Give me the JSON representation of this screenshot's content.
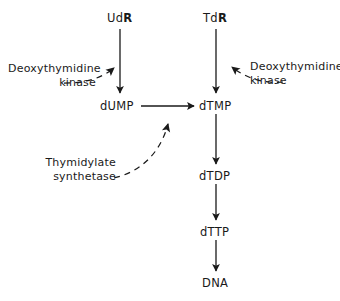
{
  "diagram": {
    "background_color": "#ffffff",
    "stroke_color": "#1a1a1a",
    "text_color": "#1a1a1a",
    "nodes": [
      {
        "id": "udr",
        "label_prefix": "Ud",
        "label_bold": "R",
        "label_suffix": "",
        "x": 107,
        "y": 12
      },
      {
        "id": "tdr",
        "label_prefix": "Td",
        "label_bold": "R",
        "label_suffix": "",
        "x": 203,
        "y": 12
      },
      {
        "id": "dump",
        "label_prefix": "dUMP",
        "label_bold": "",
        "label_suffix": "",
        "x": 100,
        "y": 100
      },
      {
        "id": "dtmp",
        "label_prefix": "dTMP",
        "label_bold": "",
        "label_suffix": "",
        "x": 199,
        "y": 100
      },
      {
        "id": "dtdp",
        "label_prefix": "dTDP",
        "label_bold": "",
        "label_suffix": "",
        "x": 199,
        "y": 170
      },
      {
        "id": "dttp",
        "label_prefix": "dTTP",
        "label_bold": "",
        "label_suffix": "",
        "x": 200,
        "y": 226
      },
      {
        "id": "dna",
        "label_prefix": "DNA",
        "label_bold": "",
        "label_suffix": "",
        "x": 202,
        "y": 277
      }
    ],
    "enzymes": [
      {
        "id": "deoxythymidine-kinase-left",
        "line1": "Deoxythymidine",
        "line2": "kinase",
        "x": 8,
        "y": 62,
        "align": "right",
        "width": 88
      },
      {
        "id": "deoxythymidine-kinase-right",
        "line1": "Deoxythymidine",
        "line2": "kinase",
        "x": 250,
        "y": 60,
        "align": "left",
        "width": 88
      },
      {
        "id": "thymidylate-synthetase",
        "line1": "Thymidylate",
        "line2": "synthetase",
        "x": 38,
        "y": 156,
        "align": "right",
        "width": 78
      }
    ],
    "reaction_arrows": [
      {
        "id": "udr-to-dump",
        "from": "UdR",
        "to": "dUMP",
        "style": "solid",
        "direction": "down"
      },
      {
        "id": "tdr-to-dtmp",
        "from": "TdR",
        "to": "dTMP",
        "style": "solid",
        "direction": "down"
      },
      {
        "id": "dump-to-dtmp",
        "from": "dUMP",
        "to": "dTMP",
        "style": "solid",
        "direction": "right"
      },
      {
        "id": "dtmp-to-dtdp",
        "from": "dTMP",
        "to": "dTDP",
        "style": "solid",
        "direction": "down"
      },
      {
        "id": "dtdp-to-dttp",
        "from": "dTDP",
        "to": "dTTP",
        "style": "solid",
        "direction": "down"
      },
      {
        "id": "dttp-to-dna",
        "from": "dTTP",
        "to": "DNA",
        "style": "solid",
        "direction": "down"
      }
    ],
    "enzyme_arrows": [
      {
        "id": "kinase-left-arrow",
        "enzyme": "Deoxythymidine kinase",
        "targets": "udr-to-dump",
        "style": "dashed"
      },
      {
        "id": "kinase-right-arrow",
        "enzyme": "Deoxythymidine kinase",
        "targets": "tdr-to-dtmp",
        "style": "dashed"
      },
      {
        "id": "synthetase-arrow",
        "enzyme": "Thymidylate synthetase",
        "targets": "dump-to-dtmp",
        "style": "dashed"
      }
    ]
  }
}
